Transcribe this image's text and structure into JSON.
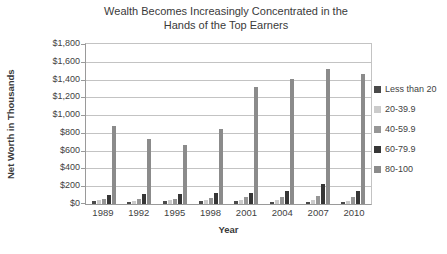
{
  "chart_data": {
    "type": "bar",
    "title": "Wealth Becomes Increasingly Concentrated in the Hands of the Top Earners",
    "title_lines": [
      "Wealth Becomes Increasingly Concentrated in the",
      "Hands of the Top Earners"
    ],
    "xlabel": "Year",
    "ylabel": "Net Worth in Thousands",
    "categories": [
      "1989",
      "1992",
      "1995",
      "1998",
      "2001",
      "2004",
      "2007",
      "2010"
    ],
    "series": [
      {
        "name": "Less than 20",
        "color": "#4a4a4a",
        "values": [
          30,
          25,
          30,
          30,
          30,
          25,
          25,
          20
        ]
      },
      {
        "name": "20-39.9",
        "color": "#cbcbcb",
        "values": [
          40,
          35,
          40,
          40,
          45,
          45,
          50,
          30
        ]
      },
      {
        "name": "40-59.9",
        "color": "#969696",
        "values": [
          60,
          55,
          60,
          65,
          75,
          80,
          90,
          80
        ]
      },
      {
        "name": "60-79.9",
        "color": "#363636",
        "values": [
          100,
          110,
          110,
          120,
          125,
          150,
          230,
          145
        ]
      },
      {
        "name": "80-100",
        "color": "#8b8b8b",
        "values": [
          880,
          730,
          660,
          845,
          1320,
          1410,
          1520,
          1460
        ]
      }
    ],
    "ylim": [
      0,
      1800
    ],
    "ytick_step": 200,
    "ytick_labels": [
      "$0",
      "$200",
      "$400",
      "$600",
      "$800",
      "$1,000",
      "$1,200",
      "$1,400",
      "$1,600",
      "$1,800"
    ],
    "grid": true,
    "legend_position": "right",
    "colors": {
      "text": "#3f3f3f",
      "gridline": "#c3c3c3",
      "axis_line": "#9a9a9a",
      "background": "#ffffff"
    }
  }
}
